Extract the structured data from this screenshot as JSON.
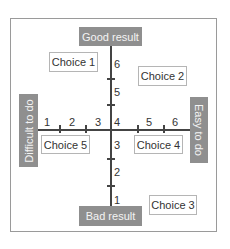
{
  "diagram": {
    "type": "quadrant-matrix",
    "axes": {
      "vertical": {
        "top_label": "Good result",
        "bottom_label": "Bad result",
        "ticks": [
          "1",
          "2",
          "3",
          "4",
          "5",
          "6"
        ]
      },
      "horizontal": {
        "left_label": "Difficult to do",
        "right_label": "Easy to do",
        "ticks": [
          "1",
          "2",
          "3",
          "4",
          "5",
          "6"
        ]
      }
    },
    "choices": [
      {
        "label": "Choice 1"
      },
      {
        "label": "Choice 2"
      },
      {
        "label": "Choice 3"
      },
      {
        "label": "Choice 4"
      },
      {
        "label": "Choice 5"
      }
    ],
    "colors": {
      "label_fill": "#8f8f8f",
      "label_text": "#f4f4f4",
      "axis": "#444444",
      "frame": "#9a9a9a"
    }
  }
}
